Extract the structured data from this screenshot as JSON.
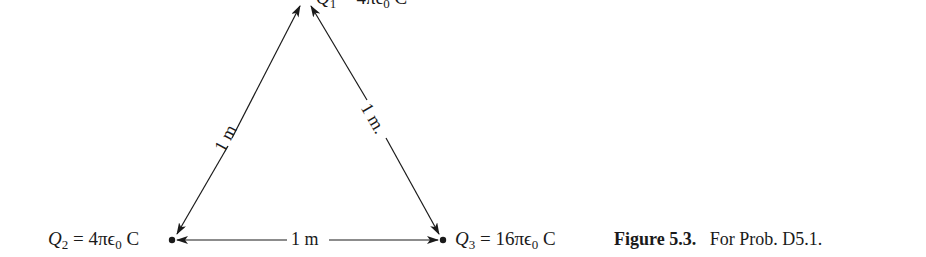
{
  "figure": {
    "number_label": "Figure 5.3.",
    "caption_text": "For Prob. D5.1."
  },
  "charges": {
    "q1": {
      "symbol": "Q",
      "subscript": "1",
      "rest": " = 4πϵ",
      "eps_sub": "0",
      "unit": " C"
    },
    "q2": {
      "symbol": "Q",
      "subscript": "2",
      "rest": " = 4πϵ",
      "eps_sub": "0",
      "unit": " C"
    },
    "q3": {
      "symbol": "Q",
      "subscript": "3",
      "rest": " = 16πϵ",
      "eps_sub": "0",
      "unit": " C"
    }
  },
  "distances": {
    "left": "1 m",
    "right": "1 m.",
    "bottom": "1 m"
  },
  "colors": {
    "ink": "#1a1a1a",
    "background": "#ffffff"
  }
}
